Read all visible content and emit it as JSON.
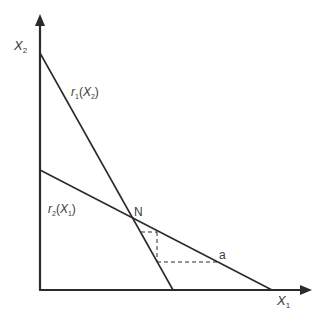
{
  "diagram": {
    "title": "",
    "axes": {
      "x_label": "X",
      "x_label_sub": "1",
      "y_label": "X",
      "y_label_sub": "2"
    },
    "curves": [
      {
        "id": "r1",
        "label_fn": "r",
        "label_fn_sub": "1",
        "label_arg": "X",
        "label_arg_sub": "2"
      },
      {
        "id": "r2",
        "label_fn": "r",
        "label_fn_sub": "2",
        "label_arg": "X",
        "label_arg_sub": "1"
      }
    ],
    "points": {
      "intersection": "N",
      "point_a": "a"
    },
    "colors": {
      "line": "#2b2b2b",
      "text": "#3a3a3a"
    }
  }
}
